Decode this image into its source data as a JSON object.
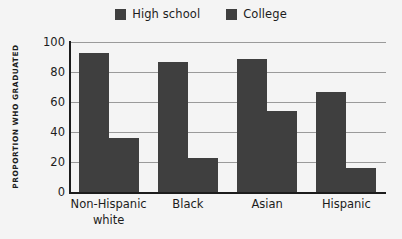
{
  "chart_data": {
    "type": "bar",
    "title": "",
    "subtitle": "",
    "xlabel": "",
    "ylabel": "PROPORTION WHO GRADUATED",
    "ylim": [
      0,
      100
    ],
    "yticks": [
      0,
      20,
      40,
      60,
      80,
      100
    ],
    "grid": true,
    "legend_position": "top-center",
    "categories": [
      "Non-Hispanic white",
      "Black",
      "Asian",
      "Hispanic"
    ],
    "category_lines": [
      [
        "Non-Hispanic",
        "white"
      ],
      [
        "Black"
      ],
      [
        "Asian"
      ],
      [
        "Hispanic"
      ]
    ],
    "series": [
      {
        "name": "High school",
        "color": "#3f3f3f",
        "values": [
          93,
          87,
          89,
          67
        ]
      },
      {
        "name": "College",
        "color": "#3f3f3f",
        "values": [
          36,
          23,
          54,
          16
        ]
      }
    ]
  },
  "legend": {
    "entries": [
      {
        "label": "High school",
        "swatch": "legend-swatch-high-school"
      },
      {
        "label": "College",
        "swatch": "legend-swatch-college"
      }
    ]
  },
  "axis": {
    "y_title": "PROPORTION WHO GRADUATED",
    "y_ticks": [
      "100",
      "80",
      "60",
      "40",
      "20",
      "0"
    ]
  },
  "colors": {
    "background": "#f4f4f4",
    "bar": "#3f3f3f",
    "axis": "#1c1c1c",
    "gridline": "#9a9a9a",
    "text": "#1c1c1c"
  }
}
